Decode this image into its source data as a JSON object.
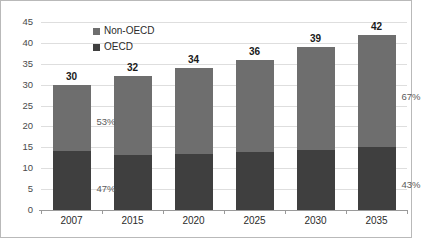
{
  "chart_data": {
    "type": "bar",
    "stacked": true,
    "title": "",
    "subtitle": "",
    "xlabel": "",
    "ylabel": "",
    "categories": [
      "2007",
      "2015",
      "2020",
      "2025",
      "2030",
      "2035"
    ],
    "series": [
      {
        "name": "OECD",
        "values": [
          14.1,
          13.2,
          13.3,
          13.9,
          14.4,
          15.1
        ],
        "color": "#3f3f3f"
      },
      {
        "name": "Non-OECD",
        "values": [
          15.9,
          18.8,
          20.7,
          22.1,
          24.6,
          26.9
        ],
        "color": "#6e6e6e"
      }
    ],
    "totals": [
      30,
      32,
      34,
      36,
      39,
      42
    ],
    "total_labels": [
      "30",
      "32",
      "34",
      "36",
      "39",
      "42"
    ],
    "ylim": [
      0,
      45
    ],
    "yticks": [
      0,
      5,
      10,
      15,
      20,
      25,
      30,
      35,
      40,
      45
    ],
    "ytick_labels": [
      "0",
      "5",
      "10",
      "15",
      "20",
      "25",
      "30",
      "35",
      "40",
      "45"
    ],
    "grid": true,
    "legend_position": "top-center",
    "annotations": [
      {
        "text": "53%",
        "category": "2007",
        "series": "Non-OECD",
        "value": 53
      },
      {
        "text": "47%",
        "category": "2007",
        "series": "OECD",
        "value": 47
      },
      {
        "text": "67%",
        "category": "2035",
        "series": "Non-OECD",
        "value": 67
      },
      {
        "text": "43%",
        "category": "2035",
        "series": "OECD",
        "value": 43
      }
    ]
  },
  "legend": {
    "items": [
      {
        "label": "Non-OECD",
        "color": "#6e6e6e"
      },
      {
        "label": "OECD",
        "color": "#3f3f3f"
      }
    ]
  },
  "colors": {
    "non_oecd": "#6e6e6e",
    "oecd": "#3f3f3f",
    "grid": "#dedede",
    "axis": "#9a9a9a",
    "border": "#b9b9b9",
    "text": "#2b2b2b",
    "annotation_text": "#5b5b5b"
  }
}
